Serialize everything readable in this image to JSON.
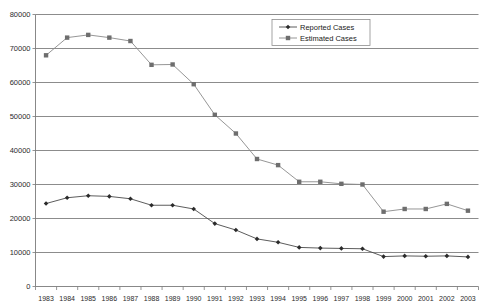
{
  "chart_data": {
    "type": "line",
    "title": "",
    "xlabel": "",
    "ylabel": "",
    "ylim": [
      0,
      80000
    ],
    "ytick_labels": [
      "0",
      "10000",
      "20000",
      "30000",
      "40000",
      "50000",
      "60000",
      "70000",
      "80000"
    ],
    "ytick_values": [
      0,
      10000,
      20000,
      30000,
      40000,
      50000,
      60000,
      70000,
      80000
    ],
    "grid": true,
    "legend_position": "top-right",
    "categories": [
      "1983",
      "1984",
      "1985",
      "1986",
      "1987",
      "1988",
      "1989",
      "1990",
      "1991",
      "1992",
      "1993",
      "1994",
      "1995",
      "1996",
      "1997",
      "1998",
      "1999",
      "2000",
      "2001",
      "2002",
      "2003"
    ],
    "series": [
      {
        "name": "Reported Cases",
        "marker": "diamond",
        "color": "#2b2b2b",
        "values": [
          24400,
          26100,
          26700,
          26500,
          25800,
          23900,
          23900,
          22800,
          18500,
          16600,
          14000,
          13000,
          11500,
          11300,
          11200,
          11100,
          8800,
          9000,
          8900,
          9000,
          8700
        ]
      },
      {
        "name": "Estimated Cases",
        "marker": "square",
        "color": "#6e6e6e",
        "values": [
          68000,
          73200,
          74000,
          73200,
          72200,
          65200,
          65300,
          59500,
          50500,
          45000,
          37500,
          35700,
          30800,
          30800,
          30200,
          30000,
          22000,
          22800,
          22800,
          24300,
          22300
        ]
      }
    ]
  },
  "legend": {
    "items": [
      {
        "label": "Reported Cases"
      },
      {
        "label": "Estimated Cases"
      }
    ]
  },
  "colors": {
    "reported": "#2b2b2b",
    "estimated": "#6e6e6e",
    "grid": "#6e6e6e",
    "background": "#ffffff"
  }
}
